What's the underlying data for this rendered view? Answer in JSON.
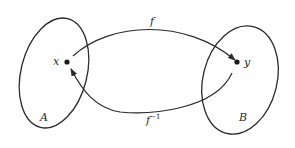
{
  "diagram": {
    "type": "function-mapping",
    "sets": [
      {
        "id": "A",
        "label": "A",
        "element": "x"
      },
      {
        "id": "B",
        "label": "B",
        "element": "y"
      }
    ],
    "points": {
      "x": {
        "label": "x"
      },
      "y": {
        "label": "y"
      }
    },
    "arrows": {
      "forward": {
        "label": "f",
        "from": "x",
        "to": "y"
      },
      "inverse": {
        "label": "f",
        "superscript": "−1",
        "from": "y",
        "to": "x"
      }
    },
    "colors": {
      "stroke": "#2a2a2a",
      "background": "#ffffff"
    }
  }
}
